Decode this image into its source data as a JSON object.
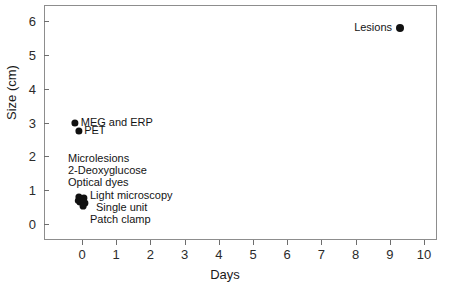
{
  "chart_data": {
    "type": "scatter",
    "title": "",
    "xlabel": "Days",
    "ylabel": "Size (cm)",
    "xlim": [
      -0.35,
      10.35
    ],
    "ylim": [
      -0.5,
      6.5
    ],
    "xticks": [
      "0",
      "1",
      "2",
      "3",
      "4",
      "5",
      "6",
      "7",
      "8",
      "9",
      "10"
    ],
    "yticks": [
      "0",
      "1",
      "2",
      "3",
      "4",
      "5",
      "6"
    ],
    "grid": false,
    "legend": "none",
    "marker_color": "#111111",
    "axis_color": "#8d8d8d",
    "points": [
      {
        "label": "Lesions",
        "x": 9.3,
        "y": 5.8,
        "r": 4.0,
        "label_side": "left"
      },
      {
        "label": "MEG and ERP",
        "x": -0.2,
        "y": 3.0,
        "r": 3.6,
        "label_side": "right"
      },
      {
        "label": "PET",
        "x": -0.1,
        "y": 2.75,
        "r": 3.6,
        "label_side": "right"
      },
      {
        "label": "Microlesions",
        "x": 0.0,
        "y": 0.52,
        "r": 3.4,
        "label_side": "stack"
      },
      {
        "label": "2-Deoxyglucose",
        "x": 0.05,
        "y": 0.48,
        "r": 3.4,
        "label_side": "stack"
      },
      {
        "label": "Optical dyes",
        "x": -0.05,
        "y": 0.45,
        "r": 3.4,
        "label_side": "stack"
      },
      {
        "label": "Light microscopy",
        "x": 0.1,
        "y": 0.4,
        "r": 3.4,
        "label_side": "stack"
      },
      {
        "label": "Single unit",
        "x": 0.02,
        "y": 0.35,
        "r": 3.4,
        "label_side": "stack"
      },
      {
        "label": "Patch clamp",
        "x": -0.02,
        "y": 0.3,
        "r": 3.4,
        "label_side": "stack"
      }
    ],
    "cluster_labels": [
      {
        "text": "Microlesions",
        "x": 68,
        "y": 159,
        "align": "left"
      },
      {
        "text": "2-Deoxyglucose",
        "x": 68,
        "y": 171,
        "align": "left"
      },
      {
        "text": "Optical dyes",
        "x": 68,
        "y": 183,
        "align": "left"
      },
      {
        "text": "Light microscopy",
        "x": 90,
        "y": 196,
        "align": "left"
      },
      {
        "text": "Single unit",
        "x": 96,
        "y": 208,
        "align": "left"
      },
      {
        "text": "Patch clamp",
        "x": 90,
        "y": 220,
        "align": "left"
      }
    ],
    "cluster_dots": [
      {
        "cx": 79,
        "cy": 197,
        "r": 3.6
      },
      {
        "cx": 84,
        "cy": 198,
        "r": 3.6
      },
      {
        "cx": 80,
        "cy": 202,
        "r": 3.6
      },
      {
        "cx": 85,
        "cy": 203,
        "r": 3.6
      },
      {
        "cx": 82,
        "cy": 200,
        "r": 4.0
      },
      {
        "cx": 83,
        "cy": 206,
        "r": 3.4
      },
      {
        "cx": 78,
        "cy": 201,
        "r": 3.2
      }
    ]
  }
}
